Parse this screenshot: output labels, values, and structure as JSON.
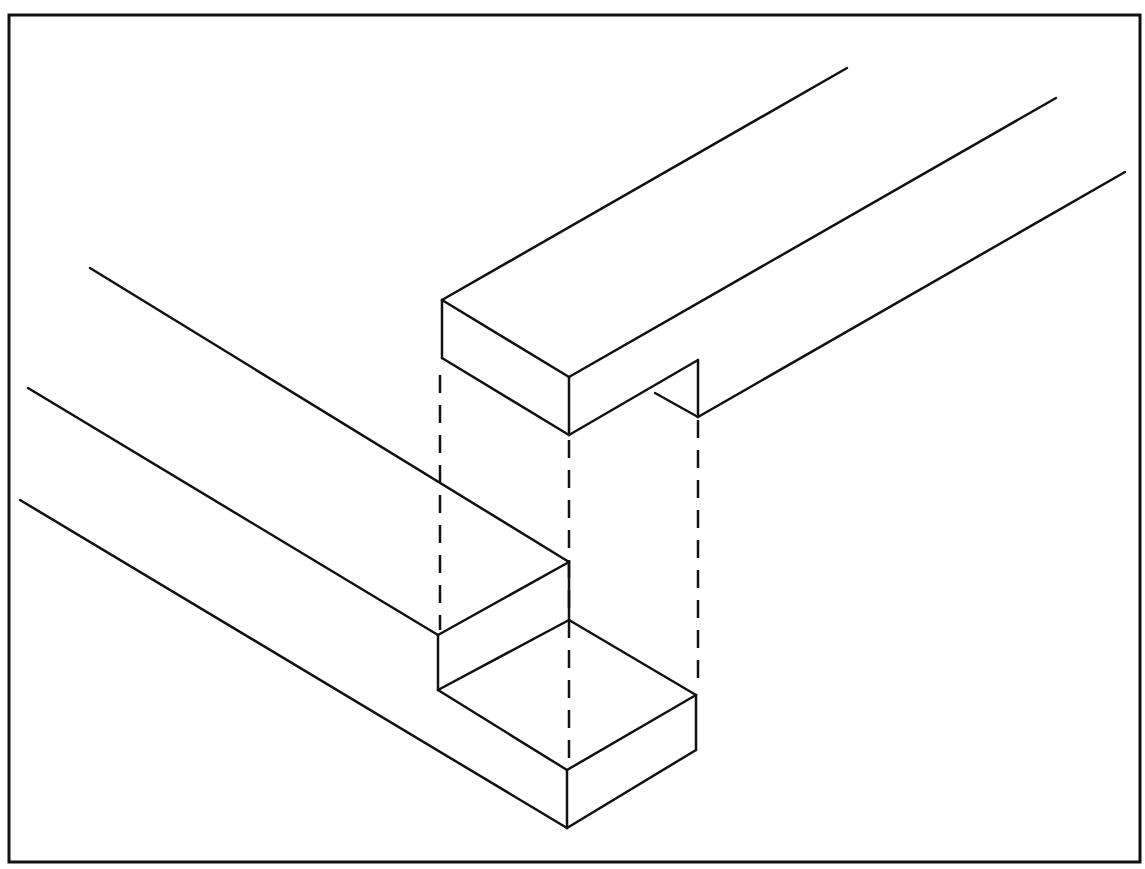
{
  "diagram": {
    "stroke_color": "#111111",
    "background": "#ffffff",
    "frame": {
      "x": 9,
      "y": 15,
      "w": 1131,
      "h": 847
    },
    "upper_piece": {
      "solid_lines": [
        [
          [
            442,
            300
          ],
          [
            847,
            68
          ]
        ],
        [
          [
            442,
            300
          ],
          [
            569,
            377
          ]
        ],
        [
          [
            569,
            377
          ],
          [
            1056,
            98
          ]
        ],
        [
          [
            442,
            300
          ],
          [
            442,
            358
          ]
        ],
        [
          [
            442,
            358
          ],
          [
            569,
            435
          ]
        ],
        [
          [
            569,
            377
          ],
          [
            569,
            435
          ]
        ],
        [
          [
            569,
            435
          ],
          [
            698,
            360
          ]
        ],
        [
          [
            698,
            360
          ],
          [
            698,
            417
          ]
        ],
        [
          [
            655,
            393
          ],
          [
            698,
            417
          ]
        ],
        [
          [
            698,
            417
          ],
          [
            1125,
            172
          ]
        ]
      ]
    },
    "lower_piece": {
      "solid_lines": [
        [
          [
            90,
            268
          ],
          [
            569,
            562
          ]
        ],
        [
          [
            28,
            388
          ],
          [
            438,
            635
          ]
        ],
        [
          [
            569,
            562
          ],
          [
            438,
            635
          ]
        ],
        [
          [
            569,
            562
          ],
          [
            569,
            620
          ]
        ],
        [
          [
            438,
            635
          ],
          [
            438,
            690
          ]
        ],
        [
          [
            438,
            690
          ],
          [
            569,
            620
          ]
        ],
        [
          [
            569,
            620
          ],
          [
            696,
            695
          ]
        ],
        [
          [
            438,
            690
          ],
          [
            567,
            770
          ]
        ],
        [
          [
            567,
            770
          ],
          [
            696,
            695
          ]
        ],
        [
          [
            696,
            695
          ],
          [
            696,
            750
          ]
        ],
        [
          [
            567,
            770
          ],
          [
            567,
            828
          ]
        ],
        [
          [
            567,
            828
          ],
          [
            696,
            750
          ]
        ],
        [
          [
            20,
            500
          ],
          [
            567,
            828
          ]
        ]
      ]
    },
    "projection_lines": [
      [
        [
          440,
          375
        ],
        [
          440,
          630
        ]
      ],
      [
        [
          569,
          440
        ],
        [
          569,
          765
        ]
      ],
      [
        [
          698,
          420
        ],
        [
          698,
          690
        ]
      ]
    ]
  }
}
